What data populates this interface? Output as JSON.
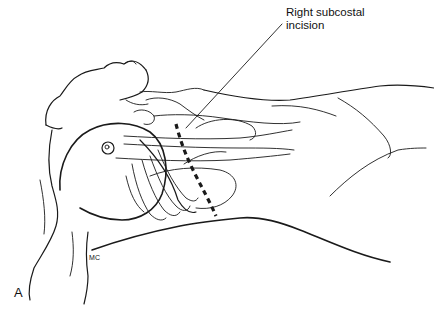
{
  "figure": {
    "type": "medical line illustration",
    "labels": {
      "callout": "Right subcostal incision",
      "callout_line1": "Right subcostal",
      "callout_line2": "incision",
      "panel_letter": "A",
      "artist_mark": "MC"
    },
    "colors": {
      "line": "#1a1a1a",
      "background": "#ffffff"
    },
    "annotations": [
      {
        "kind": "leader-line",
        "target": "incision",
        "from": [
          282,
          25
        ],
        "to": [
          186,
          128
        ]
      },
      {
        "kind": "dashed-line",
        "meaning": "incision path",
        "from": [
          178,
          125
        ],
        "to": [
          216,
          215
        ]
      }
    ]
  }
}
